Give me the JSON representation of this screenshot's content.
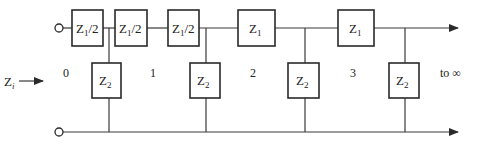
{
  "diagram": {
    "type": "ladder network (infinite T/L sections)",
    "input_label": {
      "main": "Z",
      "sub": "i"
    },
    "termination_label": "to ∞",
    "node_labels": [
      "0",
      "1",
      "2",
      "3"
    ],
    "series_elements": [
      {
        "main": "Z",
        "sub": "1",
        "suffix": "/2"
      },
      {
        "main": "Z",
        "sub": "1",
        "suffix": "/2"
      },
      {
        "main": "Z",
        "sub": "1",
        "suffix": "/2"
      },
      {
        "main": "Z",
        "sub": "1",
        "suffix": ""
      },
      {
        "main": "Z",
        "sub": "1",
        "suffix": ""
      }
    ],
    "shunt_elements": [
      {
        "main": "Z",
        "sub": "2"
      },
      {
        "main": "Z",
        "sub": "2"
      },
      {
        "main": "Z",
        "sub": "2"
      },
      {
        "main": "Z",
        "sub": "2"
      }
    ],
    "colors": {
      "line": "#3a3a3a",
      "box_border": "#2a2a2a",
      "background": "#ffffff"
    }
  }
}
